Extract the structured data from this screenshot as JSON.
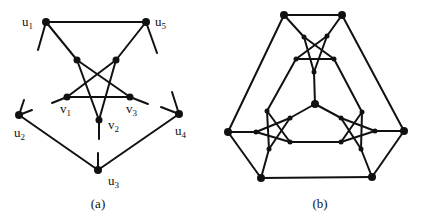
{
  "figure": {
    "panels": [
      {
        "id": "a",
        "caption": "(a)",
        "caption_pos": [
          98,
          208
        ],
        "nodes": [
          {
            "id": "u1",
            "x": 46,
            "y": 22,
            "r": 4,
            "label": "u",
            "sub": "1",
            "lx": 22,
            "ly": 26
          },
          {
            "id": "u5",
            "x": 146,
            "y": 22,
            "r": 4,
            "label": "u",
            "sub": "5",
            "lx": 155,
            "ly": 26
          },
          {
            "id": "p1",
            "x": 77,
            "y": 60,
            "r": 3.5
          },
          {
            "id": "p2",
            "x": 116,
            "y": 60,
            "r": 3.5
          },
          {
            "id": "v1",
            "x": 67,
            "y": 97,
            "r": 3.5,
            "label": "v",
            "sub": "1",
            "lx": 60,
            "ly": 113
          },
          {
            "id": "v3",
            "x": 130,
            "y": 97,
            "r": 3.5,
            "label": "v",
            "sub": "3",
            "lx": 126,
            "ly": 113
          },
          {
            "id": "v2",
            "x": 99,
            "y": 120,
            "r": 3.5,
            "label": "v",
            "sub": "2",
            "lx": 108,
            "ly": 129
          },
          {
            "id": "u2",
            "x": 19,
            "y": 115,
            "r": 4,
            "label": "u",
            "sub": "2",
            "lx": 14,
            "ly": 137
          },
          {
            "id": "u4",
            "x": 179,
            "y": 114,
            "r": 4,
            "label": "u",
            "sub": "4",
            "lx": 175,
            "ly": 135
          },
          {
            "id": "u3",
            "x": 98,
            "y": 170,
            "r": 4,
            "label": "u",
            "sub": "3",
            "lx": 108,
            "ly": 185
          }
        ],
        "edges": [
          [
            46,
            22,
            146,
            22
          ],
          [
            46,
            22,
            77,
            60
          ],
          [
            77,
            60,
            130,
            97
          ],
          [
            130,
            97,
            148,
            104
          ],
          [
            146,
            22,
            116,
            60
          ],
          [
            116,
            60,
            67,
            97
          ],
          [
            67,
            97,
            52,
            103
          ],
          [
            77,
            60,
            99,
            120
          ],
          [
            116,
            60,
            99,
            120
          ],
          [
            67,
            97,
            130,
            97
          ],
          [
            99,
            120,
            99,
            139
          ],
          [
            46,
            22,
            38,
            50
          ],
          [
            146,
            22,
            157,
            53
          ],
          [
            19,
            115,
            24,
            100
          ],
          [
            19,
            115,
            32,
            110
          ],
          [
            179,
            114,
            172,
            92
          ],
          [
            179,
            114,
            161,
            107
          ],
          [
            19,
            115,
            98,
            170
          ],
          [
            179,
            114,
            98,
            170
          ],
          [
            98,
            170,
            98,
            153
          ]
        ]
      },
      {
        "id": "b",
        "caption": "(b)",
        "caption_pos": [
          320,
          208
        ],
        "nodes": [
          {
            "id": "t1",
            "x": 284,
            "y": 15,
            "r": 4
          },
          {
            "id": "t2",
            "x": 342,
            "y": 15,
            "r": 4
          },
          {
            "id": "ol",
            "x": 228,
            "y": 132,
            "r": 4
          },
          {
            "id": "or",
            "x": 404,
            "y": 131,
            "r": 4
          },
          {
            "id": "bl",
            "x": 261,
            "y": 178,
            "r": 4
          },
          {
            "id": "br",
            "x": 372,
            "y": 177,
            "r": 4
          },
          {
            "id": "c",
            "x": 315,
            "y": 104,
            "r": 4
          },
          {
            "id": "tp1",
            "x": 304,
            "y": 37,
            "r": 2.5
          },
          {
            "id": "tp2",
            "x": 327,
            "y": 36,
            "r": 2.5
          },
          {
            "id": "tp3",
            "x": 296,
            "y": 59,
            "r": 2.5
          },
          {
            "id": "tp4",
            "x": 334,
            "y": 59,
            "r": 2.5
          },
          {
            "id": "tp5",
            "x": 314,
            "y": 72,
            "r": 2.5
          },
          {
            "id": "lp1",
            "x": 267,
            "y": 111,
            "r": 2.5
          },
          {
            "id": "lp2",
            "x": 290,
            "y": 118,
            "r": 2.5
          },
          {
            "id": "lp3",
            "x": 290,
            "y": 142,
            "r": 2.5
          },
          {
            "id": "lp4",
            "x": 269,
            "y": 149,
            "r": 2.5
          },
          {
            "id": "lp5",
            "x": 256,
            "y": 132,
            "r": 2.5
          },
          {
            "id": "rp1",
            "x": 362,
            "y": 112,
            "r": 2.5
          },
          {
            "id": "rp2",
            "x": 341,
            "y": 118,
            "r": 2.5
          },
          {
            "id": "rp3",
            "x": 341,
            "y": 142,
            "r": 2.5
          },
          {
            "id": "rp4",
            "x": 361,
            "y": 149,
            "r": 2.5
          },
          {
            "id": "rp5",
            "x": 375,
            "y": 131,
            "r": 2.5
          }
        ],
        "edges": [
          [
            284,
            15,
            342,
            15
          ],
          [
            284,
            15,
            228,
            132
          ],
          [
            342,
            15,
            404,
            131
          ],
          [
            228,
            132,
            261,
            178
          ],
          [
            404,
            131,
            372,
            177
          ],
          [
            261,
            178,
            372,
            177
          ],
          [
            284,
            15,
            304,
            37
          ],
          [
            342,
            15,
            327,
            36
          ],
          [
            304,
            37,
            334,
            59
          ],
          [
            304,
            37,
            314,
            72
          ],
          [
            327,
            36,
            296,
            59
          ],
          [
            327,
            36,
            314,
            72
          ],
          [
            296,
            59,
            334,
            59
          ],
          [
            296,
            59,
            267,
            111
          ],
          [
            334,
            59,
            362,
            112
          ],
          [
            314,
            72,
            315,
            104
          ],
          [
            315,
            104,
            290,
            118
          ],
          [
            315,
            104,
            341,
            118
          ],
          [
            267,
            111,
            290,
            142
          ],
          [
            267,
            111,
            269,
            149
          ],
          [
            290,
            118,
            269,
            149
          ],
          [
            290,
            118,
            256,
            132
          ],
          [
            290,
            142,
            256,
            132
          ],
          [
            362,
            112,
            341,
            142
          ],
          [
            362,
            112,
            361,
            149
          ],
          [
            341,
            118,
            361,
            149
          ],
          [
            341,
            118,
            375,
            131
          ],
          [
            341,
            142,
            375,
            131
          ],
          [
            228,
            132,
            256,
            132
          ],
          [
            261,
            178,
            269,
            149
          ],
          [
            404,
            131,
            375,
            131
          ],
          [
            372,
            177,
            361,
            149
          ],
          [
            290,
            142,
            341,
            142
          ]
        ]
      }
    ]
  }
}
